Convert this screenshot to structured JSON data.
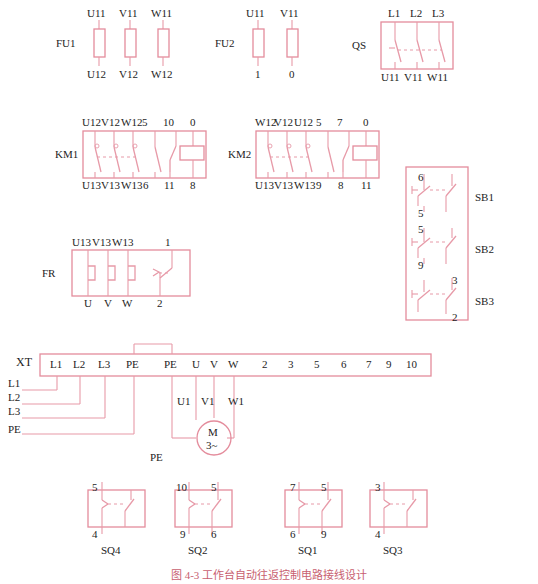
{
  "figure": {
    "caption": "图 4-3   工作台自动往返控制电路接线设计",
    "line_color": "#e79aa8",
    "box_color": "#e48c9c",
    "text_color": "#1d1d1d"
  },
  "components": {
    "fu1": {
      "name": "FU1",
      "top_labels": [
        "U11",
        "V11",
        "W11"
      ],
      "bottom_labels": [
        "U12",
        "V12",
        "W12"
      ]
    },
    "fu2": {
      "name": "FU2",
      "top_labels": [
        "U11",
        "V11"
      ],
      "bottom_labels": [
        "1",
        "0"
      ]
    },
    "qs": {
      "name": "QS",
      "top_labels": [
        "L1",
        "L2",
        "L3"
      ],
      "bottom_labels": [
        "U11",
        "V11",
        "W11"
      ]
    },
    "km1": {
      "name": "KM1",
      "top_labels": [
        "U12",
        "V12",
        "W12",
        "5",
        "10",
        "0"
      ],
      "bottom_labels": [
        "U13",
        "V13",
        "W13",
        "6",
        "11",
        "8"
      ]
    },
    "km2": {
      "name": "KM2",
      "top_labels": [
        "W12",
        "V12",
        "U12",
        "5",
        "7",
        "0"
      ],
      "bottom_labels": [
        "U13",
        "V13",
        "W13",
        "9",
        "8",
        "11"
      ]
    },
    "fr": {
      "name": "FR",
      "top_labels": [
        "U13",
        "V13",
        "W13",
        "1"
      ],
      "bottom_labels": [
        "U",
        "V",
        "W",
        "2"
      ]
    },
    "sb_panel": {
      "buttons": [
        {
          "name": "SB1",
          "top": "6",
          "bottom": "5"
        },
        {
          "name": "SB2",
          "top": "5",
          "bottom": "9"
        },
        {
          "name": "SB3",
          "top": "3",
          "bottom": "2"
        }
      ]
    },
    "xt": {
      "name": "XT",
      "terminals": [
        "L1",
        "L2",
        "L3",
        "PE",
        "PE",
        "U",
        "V",
        "W",
        "2",
        "3",
        "5",
        "6",
        "7",
        "9",
        "10"
      ]
    },
    "supply_lines": [
      "L1",
      "L2",
      "L3",
      "PE"
    ],
    "motor": {
      "symbol_top": "M",
      "symbol_bottom": "3~",
      "phase_labels": [
        "U1",
        "V1",
        "W1"
      ],
      "ground_label": "PE"
    },
    "limit_switches": [
      {
        "name": "SQ4",
        "top_left": "5",
        "top_right": "",
        "bottom_left": "4",
        "bottom_right": ""
      },
      {
        "name": "SQ2",
        "top_left": "10",
        "top_right": "5",
        "bottom_left": "9",
        "bottom_right": "6"
      },
      {
        "name": "SQ1",
        "top_left": "7",
        "top_right": "5",
        "bottom_left": "6",
        "bottom_right": "9"
      },
      {
        "name": "SQ3",
        "top_left": "3",
        "top_right": "",
        "bottom_left": "4",
        "bottom_right": ""
      }
    ]
  }
}
